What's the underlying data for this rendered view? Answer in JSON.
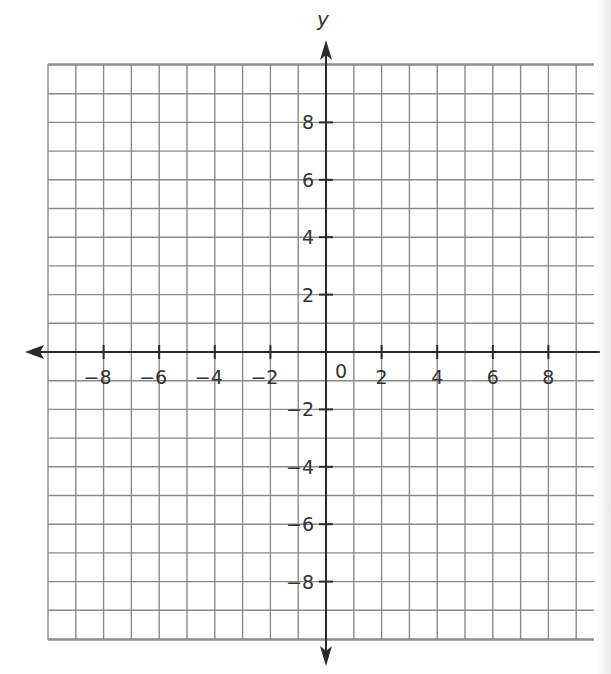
{
  "diagram": {
    "type": "coordinate-plane",
    "x_axis": {
      "name": "",
      "range": [
        -10,
        10
      ],
      "tick_labels": [
        {
          "value": -8,
          "label": "−8"
        },
        {
          "value": -6,
          "label": "−6"
        },
        {
          "value": -4,
          "label": "−4"
        },
        {
          "value": -2,
          "label": "−2"
        },
        {
          "value": 2,
          "label": "2"
        },
        {
          "value": 4,
          "label": "4"
        },
        {
          "value": 6,
          "label": "6"
        },
        {
          "value": 8,
          "label": "8"
        }
      ]
    },
    "y_axis": {
      "name": "y",
      "range": [
        -10,
        10
      ],
      "tick_labels": [
        {
          "value": 8,
          "label": "8"
        },
        {
          "value": 6,
          "label": "6"
        },
        {
          "value": 4,
          "label": "4"
        },
        {
          "value": 2,
          "label": "2"
        },
        {
          "value": -2,
          "label": "−2"
        },
        {
          "value": -4,
          "label": "−4"
        },
        {
          "value": -6,
          "label": "−6"
        },
        {
          "value": -8,
          "label": "−8"
        }
      ]
    },
    "origin_label": "0",
    "grid_step": 1,
    "grid_color": "#8a8a8a",
    "axis_color": "#2a2a2a"
  }
}
